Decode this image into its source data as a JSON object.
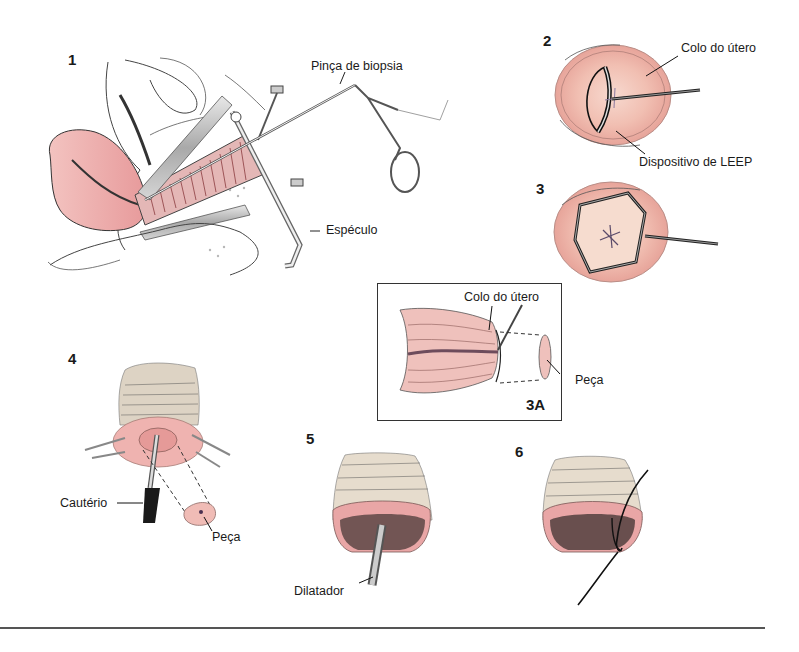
{
  "figure": {
    "topic": "LEEP / conização do colo do útero",
    "panels": [
      {
        "id": "1",
        "labels": [
          "Pinça de biopsia",
          "Espéculo"
        ]
      },
      {
        "id": "2",
        "labels": [
          "Colo do útero",
          "Dispositivo de LEEP"
        ]
      },
      {
        "id": "3",
        "labels": []
      },
      {
        "id": "3A",
        "labels": [
          "Colo do útero",
          "Peça"
        ]
      },
      {
        "id": "4",
        "labels": [
          "Cautério",
          "Peça"
        ]
      },
      {
        "id": "5",
        "labels": [
          "Dilatador"
        ]
      },
      {
        "id": "6",
        "labels": []
      }
    ]
  },
  "panel1": {
    "number": "1",
    "biopsy_forceps": "Pinça de biopsia",
    "speculum": "Espéculo"
  },
  "panel2": {
    "number": "2",
    "cervix": "Colo do útero",
    "leep_device": "Dispositivo de LEEP"
  },
  "panel3": {
    "number": "3"
  },
  "panel3a": {
    "number": "3A",
    "cervix": "Colo do útero",
    "specimen": "Peça"
  },
  "panel4": {
    "number": "4",
    "cautery": "Cautério",
    "specimen": "Peça"
  },
  "panel5": {
    "number": "5",
    "dilator": "Dilatador"
  },
  "panel6": {
    "number": "6"
  },
  "colors": {
    "tissue_pink": "#e8a0a0",
    "tissue_light": "#f4c9bf",
    "line": "#222222",
    "instrument": "#bfbfbf"
  }
}
